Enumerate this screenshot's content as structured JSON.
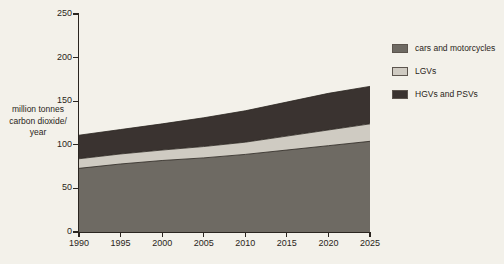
{
  "chart_data": {
    "type": "area",
    "stacked": true,
    "title": "",
    "xlabel": "",
    "ylabel": "million tonnes\ncarbon dioxide/\nyear",
    "xlim": [
      1990,
      2025
    ],
    "ylim": [
      0,
      250
    ],
    "grid": false,
    "legend_position": "right",
    "x": [
      1990,
      1995,
      2000,
      2005,
      2010,
      2015,
      2020,
      2025
    ],
    "xtick_labels": [
      "1990",
      "1995",
      "2000",
      "2005",
      "2010",
      "2015",
      "2020",
      "2025"
    ],
    "ytick_labels": [
      "0",
      "50",
      "100",
      "150",
      "200",
      "250"
    ],
    "yticks": [
      0,
      50,
      100,
      150,
      200,
      250
    ],
    "series": [
      {
        "name": "cars and motorcycles",
        "color": "#6e6a63",
        "values": [
          73,
          78,
          82,
          85,
          89,
          94,
          99,
          104
        ]
      },
      {
        "name": "LGVs",
        "color": "#cfcbc2",
        "values": [
          11,
          11.5,
          12,
          13,
          14,
          16,
          18,
          20
        ]
      },
      {
        "name": "HGVs and PSVs",
        "color": "#3a3330",
        "values": [
          27,
          28,
          30,
          33,
          36,
          39,
          42,
          43
        ]
      }
    ],
    "cumulative_tops": {
      "cars and motorcycles": [
        73,
        78,
        82,
        85,
        89,
        94,
        99,
        104
      ],
      "LGVs": [
        84,
        89.5,
        94,
        98,
        103,
        110,
        117,
        124
      ],
      "HGVs and PSVs": [
        111,
        117.5,
        124,
        131,
        139,
        149,
        159,
        167
      ]
    }
  },
  "legend": {
    "items": [
      {
        "label": "cars and motorcycles",
        "color": "#6e6a63"
      },
      {
        "label": "LGVs",
        "color": "#cfcbc2"
      },
      {
        "label": "HGVs and PSVs",
        "color": "#3a3330"
      }
    ]
  },
  "axis": {
    "y_caption": "million tonnes\ncarbon dioxide/\nyear"
  },
  "colors": {
    "background": "#f3f1ea",
    "ink": "#2a2520",
    "cars": "#6e6a63",
    "lgvs": "#cfcbc2",
    "hgvs": "#3a3330"
  }
}
